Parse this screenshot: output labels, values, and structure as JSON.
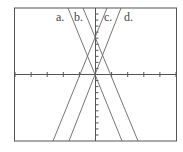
{
  "chart_data": {
    "type": "line",
    "title": "",
    "xlabel": "",
    "ylabel": "",
    "grid": false,
    "xlim": [
      -5,
      5
    ],
    "ylim": [
      -11,
      11
    ],
    "x_tick_spacing": 1,
    "y_tick_spacing": 1,
    "series": [
      {
        "name": "a.",
        "x": [
          -1.69,
          1.69
        ],
        "y": [
          11,
          -11
        ],
        "label_x": -1.9,
        "label_y": 10.6
      },
      {
        "name": "b.",
        "x": [
          -0.75,
          2.69
        ],
        "y": [
          11,
          -11
        ],
        "label_x": -1.0,
        "label_y": 10.6
      },
      {
        "name": "c.",
        "x": [
          0.75,
          -2.69
        ],
        "y": [
          11,
          -11
        ],
        "label_x": 1.2,
        "label_y": 10.6
      },
      {
        "name": "d.",
        "x": [
          1.69,
          -1.69
        ],
        "y": [
          11,
          -11
        ],
        "label_x": 2.2,
        "label_y": 10.6
      }
    ],
    "annotations": [
      "a.",
      "b.",
      "c.",
      "d."
    ]
  },
  "labels": {
    "a": "a.",
    "b": "b.",
    "c": "c.",
    "d": "d."
  }
}
